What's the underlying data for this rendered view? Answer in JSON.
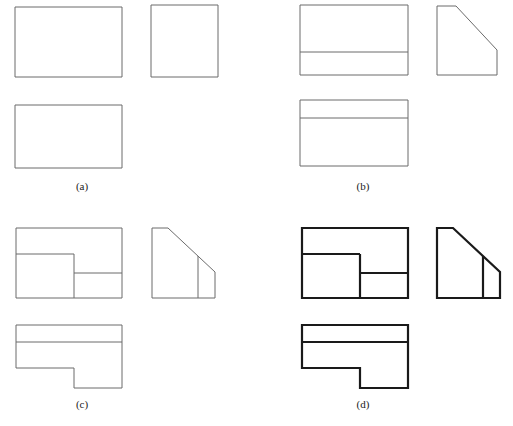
{
  "figure": {
    "background_color": "#ffffff",
    "width": 513,
    "height": 426,
    "thin_line_color": "#6b6b6b",
    "thick_line_color": "#1a1a1a",
    "thin_line_width": 1,
    "thick_line_width": 2.2
  },
  "captions": {
    "a": "(a)",
    "b": "(b)",
    "c": "(c)",
    "d": "(d)"
  },
  "panels": [
    {
      "id": "a",
      "label": "(a)",
      "line_weight": "thin",
      "views": {
        "front": {
          "name": "front-view",
          "outline": [
            [
              15,
              7
            ],
            [
              122,
              7
            ],
            [
              122,
              77
            ],
            [
              15,
              77
            ]
          ],
          "internal_lines": []
        },
        "side": {
          "name": "side-view",
          "outline": [
            [
              151,
              5
            ],
            [
              218,
              5
            ],
            [
              218,
              77
            ],
            [
              151,
              77
            ]
          ],
          "internal_lines": []
        },
        "top": {
          "name": "top-view",
          "outline": [
            [
              15,
              105
            ],
            [
              122,
              105
            ],
            [
              122,
              168
            ],
            [
              15,
              168
            ]
          ],
          "internal_lines": []
        }
      }
    },
    {
      "id": "b",
      "label": "(b)",
      "line_weight": "thin",
      "views": {
        "front": {
          "name": "front-view",
          "outline": [
            [
              300,
              5
            ],
            [
              408,
              5
            ],
            [
              408,
              75
            ],
            [
              300,
              75
            ]
          ],
          "internal_lines": [
            [
              [
                300,
                52
              ],
              [
                408,
                52
              ]
            ]
          ]
        },
        "side": {
          "name": "side-view-chamfered",
          "outline": [
            [
              437,
              6
            ],
            [
              456,
              6
            ],
            [
              497,
              50
            ],
            [
              497,
              75
            ],
            [
              437,
              75
            ]
          ],
          "internal_lines": []
        },
        "top": {
          "name": "top-view",
          "outline": [
            [
              300,
              100
            ],
            [
              408,
              100
            ],
            [
              408,
              166
            ],
            [
              300,
              166
            ]
          ],
          "internal_lines": [
            [
              [
                300,
                118
              ],
              [
                408,
                118
              ]
            ]
          ]
        }
      }
    },
    {
      "id": "c",
      "label": "(c)",
      "line_weight": "thin",
      "views": {
        "front": {
          "name": "front-view",
          "outline": [
            [
              16,
              228
            ],
            [
              122,
              228
            ],
            [
              122,
              298
            ],
            [
              16,
              298
            ]
          ],
          "internal_lines": [
            [
              [
                16,
                254
              ],
              [
                74,
                254
              ]
            ],
            [
              [
                74,
                254
              ],
              [
                74,
                298
              ]
            ],
            [
              [
                74,
                273
              ],
              [
                122,
                273
              ]
            ]
          ]
        },
        "side": {
          "name": "side-view-chamfered",
          "outline": [
            [
              152,
              228
            ],
            [
              168,
              228
            ],
            [
              215,
              272
            ],
            [
              215,
              298
            ],
            [
              152,
              298
            ]
          ],
          "internal_lines": [
            [
              [
                198,
                256
              ],
              [
                198,
                298
              ]
            ]
          ]
        },
        "top": {
          "name": "top-view-l-shaped",
          "outline": [
            [
              16,
              325
            ],
            [
              122,
              325
            ],
            [
              122,
              388
            ],
            [
              74,
              388
            ],
            [
              74,
              368
            ],
            [
              16,
              368
            ]
          ],
          "internal_lines": [
            [
              [
                16,
                342
              ],
              [
                122,
                342
              ]
            ]
          ]
        }
      }
    },
    {
      "id": "d",
      "label": "(d)",
      "line_weight": "thick",
      "views": {
        "front": {
          "name": "front-view",
          "outline": [
            [
              302,
              228
            ],
            [
              408,
              228
            ],
            [
              408,
              298
            ],
            [
              302,
              298
            ]
          ],
          "internal_lines": [
            [
              [
                302,
                254
              ],
              [
                360,
                254
              ]
            ],
            [
              [
                360,
                254
              ],
              [
                360,
                298
              ]
            ],
            [
              [
                360,
                273
              ],
              [
                408,
                273
              ]
            ]
          ]
        },
        "side": {
          "name": "side-view-chamfered",
          "outline": [
            [
              437,
              228
            ],
            [
              453,
              228
            ],
            [
              500,
              272
            ],
            [
              500,
              298
            ],
            [
              437,
              298
            ]
          ],
          "internal_lines": [
            [
              [
                483,
                256
              ],
              [
                483,
                298
              ]
            ]
          ]
        },
        "top": {
          "name": "top-view-l-shaped",
          "outline": [
            [
              302,
              325
            ],
            [
              408,
              325
            ],
            [
              408,
              388
            ],
            [
              360,
              388
            ],
            [
              360,
              368
            ],
            [
              302,
              368
            ]
          ],
          "internal_lines": [
            [
              [
                302,
                342
              ],
              [
                408,
                342
              ]
            ]
          ]
        }
      }
    }
  ]
}
